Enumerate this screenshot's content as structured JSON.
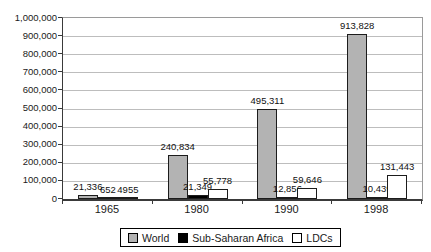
{
  "chart_data": {
    "type": "bar",
    "title": "",
    "xlabel": "",
    "ylabel": "",
    "categories": [
      "1965",
      "1980",
      "1990",
      "1998"
    ],
    "series": [
      {
        "name": "World",
        "color": "#b3b3b3",
        "values": [
          21336,
          240834,
          495311,
          913828
        ],
        "labels": [
          "21,336",
          "240,834",
          "495,311",
          "913,828"
        ]
      },
      {
        "name": "Sub-Saharan Africa",
        "color": "#000000",
        "values": [
          652,
          21349,
          12856,
          10439
        ],
        "labels": [
          "652",
          "21,349",
          "12,856",
          "10,439"
        ]
      },
      {
        "name": "LDCs",
        "color": "#ffffff",
        "values": [
          4955,
          55778,
          59646,
          131443
        ],
        "labels": [
          "4955",
          "55,778",
          "59,646",
          "131,443"
        ]
      }
    ],
    "ylim": [
      0,
      1000000
    ],
    "ytick_step": 100000,
    "ytick_labels": [
      "0",
      "100,000",
      "200,000",
      "300,000",
      "400,000",
      "500,000",
      "600,000",
      "700,000",
      "800,000",
      "900,000",
      "1,000,000"
    ],
    "grid": true,
    "data_labels": true,
    "legend_position": "bottom",
    "colors": {
      "grid": "#bdbdbd",
      "axis": "#3a3a3a",
      "text": "#1a1a1a"
    }
  }
}
